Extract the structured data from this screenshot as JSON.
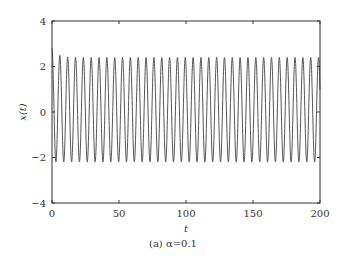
{
  "chart_data": {
    "type": "line",
    "title": "",
    "xlabel": "t",
    "ylabel": "x(t)",
    "xlim": [
      0,
      200
    ],
    "ylim": [
      -4,
      4
    ],
    "xticks": [
      0,
      50,
      100,
      150,
      200
    ],
    "yticks": [
      -4,
      -2,
      0,
      2,
      4
    ],
    "xtick_labels": [
      "0",
      "50",
      "100",
      "150",
      "200"
    ],
    "ytick_labels": [
      "−4",
      "−2",
      "0",
      "2",
      "4"
    ],
    "grid": false,
    "legend": null,
    "series": [
      {
        "name": "x(t)",
        "description": "sustained oscillation, ~34 cycles over t=0..200, initial peak ~2.8 decaying to steady amplitude",
        "period": 5.85,
        "peak_initial": 2.8,
        "peak_steady": 2.4,
        "trough_steady": -2.2,
        "x": [
          0,
          1.46,
          2.93,
          4.39,
          5.85,
          7.31,
          8.78,
          10.24,
          11.7,
          50,
          100,
          150,
          200
        ],
        "y": [
          2.8,
          0.1,
          -2.2,
          0.1,
          2.6,
          0.1,
          -2.2,
          0.1,
          2.5,
          2.4,
          2.4,
          2.4,
          2.4
        ]
      }
    ],
    "color": "#555555"
  },
  "caption": "(a) α=0.1"
}
